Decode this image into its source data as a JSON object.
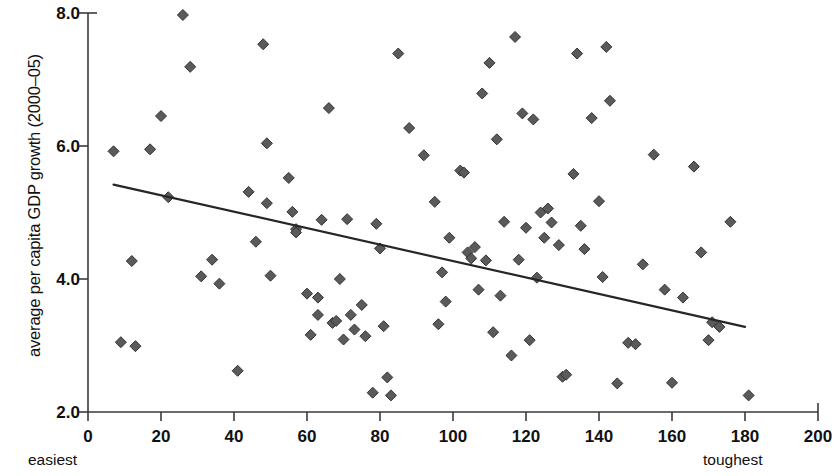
{
  "chart_data": {
    "type": "scatter",
    "title": "",
    "subtitle": "",
    "xlabel": "",
    "ylabel": "average per capita GDP growth (2000–05)",
    "xlim": [
      0,
      200
    ],
    "ylim": [
      2.0,
      8.0
    ],
    "grid": false,
    "legend_position": "none",
    "x_ticks": [
      0,
      20,
      40,
      60,
      80,
      100,
      120,
      140,
      160,
      180,
      200
    ],
    "x_tick_labels": [
      "0",
      "20",
      "40",
      "60",
      "80",
      "100",
      "120",
      "140",
      "160",
      "180",
      "200"
    ],
    "y_ticks": [
      2.0,
      4.0,
      6.0,
      8.0
    ],
    "y_tick_labels": [
      "2.0",
      "4.0",
      "6.0",
      "8.0"
    ],
    "axis_end_labels": {
      "x_left": "easiest",
      "x_right": "toughest"
    },
    "marker": {
      "shape": "diamond",
      "color": "#5a5a5a",
      "edge_color": "#333333",
      "size_px": 11
    },
    "trendline": {
      "type": "linear",
      "color": "#262626",
      "width_px": 2.2,
      "x_start": 7,
      "y_start": 5.42,
      "x_end": 180,
      "y_end": 3.28
    },
    "points": [
      {
        "x": 7,
        "y": 5.92
      },
      {
        "x": 9,
        "y": 3.05
      },
      {
        "x": 12,
        "y": 4.27
      },
      {
        "x": 13,
        "y": 2.99
      },
      {
        "x": 17,
        "y": 5.95
      },
      {
        "x": 20,
        "y": 6.45
      },
      {
        "x": 22,
        "y": 5.23
      },
      {
        "x": 26,
        "y": 7.97
      },
      {
        "x": 28,
        "y": 7.19
      },
      {
        "x": 31,
        "y": 4.04
      },
      {
        "x": 34,
        "y": 4.29
      },
      {
        "x": 36,
        "y": 3.93
      },
      {
        "x": 41,
        "y": 2.62
      },
      {
        "x": 44,
        "y": 5.31
      },
      {
        "x": 46,
        "y": 4.56
      },
      {
        "x": 48,
        "y": 7.53
      },
      {
        "x": 49,
        "y": 5.14
      },
      {
        "x": 49,
        "y": 6.04
      },
      {
        "x": 50,
        "y": 4.05
      },
      {
        "x": 55,
        "y": 5.52
      },
      {
        "x": 56,
        "y": 5.01
      },
      {
        "x": 57,
        "y": 4.75
      },
      {
        "x": 57,
        "y": 4.7
      },
      {
        "x": 60,
        "y": 3.78
      },
      {
        "x": 61,
        "y": 3.16
      },
      {
        "x": 63,
        "y": 3.46
      },
      {
        "x": 63,
        "y": 3.72
      },
      {
        "x": 64,
        "y": 4.89
      },
      {
        "x": 66,
        "y": 6.57
      },
      {
        "x": 67,
        "y": 3.34
      },
      {
        "x": 68,
        "y": 3.37
      },
      {
        "x": 69,
        "y": 4.0
      },
      {
        "x": 70,
        "y": 3.09
      },
      {
        "x": 71,
        "y": 4.9
      },
      {
        "x": 72,
        "y": 3.46
      },
      {
        "x": 73,
        "y": 3.24
      },
      {
        "x": 75,
        "y": 3.61
      },
      {
        "x": 76,
        "y": 3.14
      },
      {
        "x": 78,
        "y": 2.29
      },
      {
        "x": 79,
        "y": 4.83
      },
      {
        "x": 80,
        "y": 4.46
      },
      {
        "x": 81,
        "y": 3.29
      },
      {
        "x": 82,
        "y": 2.52
      },
      {
        "x": 83,
        "y": 2.25
      },
      {
        "x": 85,
        "y": 7.39
      },
      {
        "x": 88,
        "y": 6.27
      },
      {
        "x": 92,
        "y": 5.86
      },
      {
        "x": 95,
        "y": 5.16
      },
      {
        "x": 96,
        "y": 3.32
      },
      {
        "x": 97,
        "y": 4.1
      },
      {
        "x": 98,
        "y": 3.66
      },
      {
        "x": 99,
        "y": 4.62
      },
      {
        "x": 102,
        "y": 5.63
      },
      {
        "x": 103,
        "y": 5.6
      },
      {
        "x": 104,
        "y": 4.4
      },
      {
        "x": 105,
        "y": 4.31
      },
      {
        "x": 106,
        "y": 4.48
      },
      {
        "x": 107,
        "y": 3.84
      },
      {
        "x": 108,
        "y": 6.79
      },
      {
        "x": 109,
        "y": 4.28
      },
      {
        "x": 110,
        "y": 7.25
      },
      {
        "x": 111,
        "y": 3.2
      },
      {
        "x": 112,
        "y": 6.1
      },
      {
        "x": 113,
        "y": 3.75
      },
      {
        "x": 114,
        "y": 4.86
      },
      {
        "x": 116,
        "y": 2.85
      },
      {
        "x": 117,
        "y": 7.64
      },
      {
        "x": 118,
        "y": 4.29
      },
      {
        "x": 119,
        "y": 6.49
      },
      {
        "x": 120,
        "y": 4.77
      },
      {
        "x": 121,
        "y": 3.08
      },
      {
        "x": 122,
        "y": 6.4
      },
      {
        "x": 123,
        "y": 4.02
      },
      {
        "x": 124,
        "y": 5.0
      },
      {
        "x": 125,
        "y": 4.62
      },
      {
        "x": 126,
        "y": 5.06
      },
      {
        "x": 127,
        "y": 4.85
      },
      {
        "x": 129,
        "y": 4.51
      },
      {
        "x": 130,
        "y": 2.53
      },
      {
        "x": 131,
        "y": 2.56
      },
      {
        "x": 133,
        "y": 5.58
      },
      {
        "x": 134,
        "y": 7.39
      },
      {
        "x": 135,
        "y": 4.8
      },
      {
        "x": 136,
        "y": 4.45
      },
      {
        "x": 138,
        "y": 6.42
      },
      {
        "x": 140,
        "y": 5.17
      },
      {
        "x": 141,
        "y": 4.03
      },
      {
        "x": 142,
        "y": 7.49
      },
      {
        "x": 143,
        "y": 6.68
      },
      {
        "x": 145,
        "y": 2.43
      },
      {
        "x": 148,
        "y": 3.04
      },
      {
        "x": 150,
        "y": 3.02
      },
      {
        "x": 152,
        "y": 4.22
      },
      {
        "x": 155,
        "y": 5.87
      },
      {
        "x": 158,
        "y": 3.84
      },
      {
        "x": 160,
        "y": 2.44
      },
      {
        "x": 163,
        "y": 3.72
      },
      {
        "x": 166,
        "y": 5.69
      },
      {
        "x": 168,
        "y": 4.4
      },
      {
        "x": 170,
        "y": 3.08
      },
      {
        "x": 171,
        "y": 3.35
      },
      {
        "x": 173,
        "y": 3.28
      },
      {
        "x": 176,
        "y": 4.86
      },
      {
        "x": 181,
        "y": 2.25
      }
    ]
  }
}
